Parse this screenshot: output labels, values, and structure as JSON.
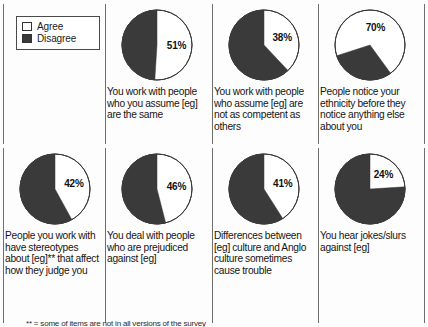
{
  "legend": {
    "name": "agree-disagree-legend",
    "items": [
      {
        "label": "Agree",
        "color": "#ffffff"
      },
      {
        "label": "Disagree",
        "color": "#3a3a3a"
      }
    ]
  },
  "footnote": {
    "text": "** = some of items are not in all versions of the survey"
  },
  "chart_data": {
    "type": "pie",
    "title": "",
    "legend_position": "top-left",
    "series_labels": [
      "Agree",
      "Disagree"
    ],
    "colors": {
      "agree": "#ffffff",
      "disagree": "#3a3a3a",
      "outline": "#3a3a3a"
    },
    "charts": [
      {
        "id": "pie-assume-same",
        "row": 0,
        "col": 1,
        "label": "51%",
        "agree": 51,
        "disagree": 49,
        "start_angle": 0,
        "caption": "You work with people who you assume [eg] are the same"
      },
      {
        "id": "pie-not-competent",
        "row": 0,
        "col": 2,
        "label": "38%",
        "agree": 38,
        "disagree": 62,
        "start_angle": 0,
        "caption": "You work with people who  assume [eg] are not as competent as others"
      },
      {
        "id": "pie-notice-ethnicity",
        "row": 0,
        "col": 3,
        "label": "70%",
        "agree": 70,
        "disagree": 30,
        "start_angle": 252,
        "caption": "People notice your ethnicity before they notice anything else about you"
      },
      {
        "id": "pie-stereotypes",
        "row": 1,
        "col": 0,
        "label": "42%",
        "agree": 42,
        "disagree": 58,
        "start_angle": 0,
        "caption": "People you work with have stereotypes about [eg]** that affect how they judge you"
      },
      {
        "id": "pie-prejudiced",
        "row": 1,
        "col": 1,
        "label": "46%",
        "agree": 46,
        "disagree": 54,
        "start_angle": 0,
        "caption": "You deal with people who are prejudiced against [eg]"
      },
      {
        "id": "pie-culture-trouble",
        "row": 1,
        "col": 2,
        "label": "41%",
        "agree": 41,
        "disagree": 59,
        "start_angle": 0,
        "caption": "Differences between [eg] culture and Anglo culture sometimes cause trouble"
      },
      {
        "id": "pie-jokes-slurs",
        "row": 1,
        "col": 3,
        "label": "24%",
        "agree": 24,
        "disagree": 76,
        "start_angle": 0,
        "caption": "You hear jokes/slurs against [eg]"
      }
    ]
  }
}
